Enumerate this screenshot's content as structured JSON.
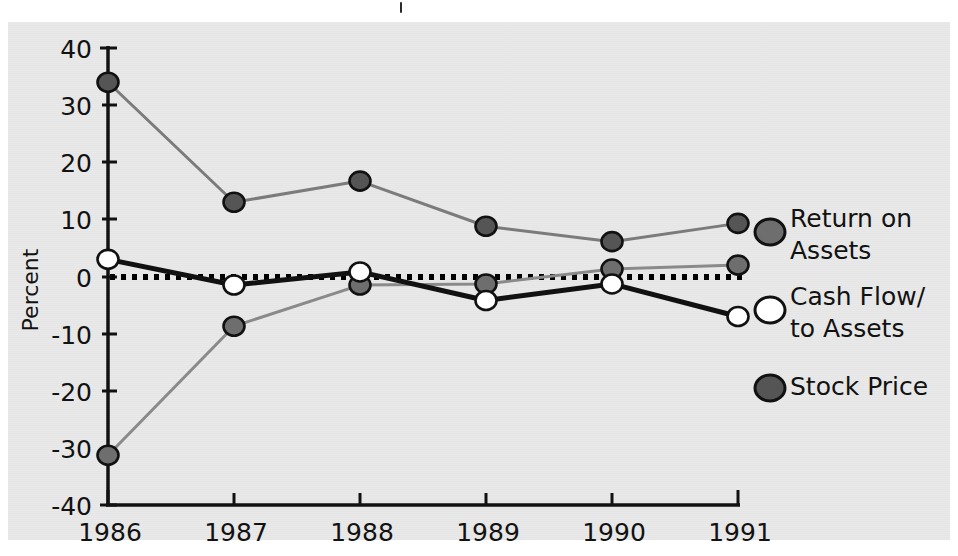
{
  "chart_data": {
    "type": "line",
    "title": "",
    "subtitle": "",
    "xlabel": "",
    "ylabel": "Percent",
    "categories": [
      "1986",
      "1987",
      "1988",
      "1989",
      "1990",
      "1991"
    ],
    "x": [
      1986,
      1987,
      1988,
      1989,
      1990,
      1991
    ],
    "xlim": [
      1986,
      1991
    ],
    "ylim": [
      -40,
      40
    ],
    "ytick_labels": [
      "40",
      "30",
      "20",
      "10",
      "0",
      "-10",
      "-20",
      "-30",
      "-40"
    ],
    "yticks": [
      40,
      30,
      20,
      10,
      0,
      -10,
      -20,
      -30,
      -40
    ],
    "grid": false,
    "zero_reference_line": {
      "value": 0,
      "style": "dotted",
      "color": "#000000"
    },
    "legend_position": "right",
    "series": [
      {
        "name": "Return on Assets",
        "legend_label_line1": "Return on",
        "legend_label_line2": "Assets",
        "values": [
          -31.3,
          -8.7,
          -1.5,
          -1.3,
          1.3,
          2.0
        ],
        "marker": "circle",
        "marker_fill": "#6e6e6e",
        "marker_edge": "#111111",
        "line_color": "#8a8a8a",
        "line_width": 3
      },
      {
        "name": "Cash Flow/to Assets",
        "legend_label_line1": "Cash Flow/",
        "legend_label_line2": "to Assets",
        "values": [
          3.0,
          -1.5,
          0.8,
          -4.2,
          -1.3,
          -7.0
        ],
        "marker": "circle",
        "marker_fill": "#ffffff",
        "marker_edge": "#111111",
        "line_color": "#111111",
        "line_width": 5
      },
      {
        "name": "Stock Price",
        "legend_label_line1": "Stock Price",
        "legend_label_line2": "",
        "values": [
          34.0,
          13.0,
          16.7,
          8.8,
          6.1,
          9.3
        ],
        "marker": "circle",
        "marker_fill": "#555555",
        "marker_edge": "#111111",
        "line_color": "#7b7b7b",
        "line_width": 3
      }
    ]
  },
  "axes": {
    "y_axis_label": "Percent",
    "y_tick_labels": [
      "40",
      "30",
      "20",
      "10",
      "0",
      "-10",
      "-20",
      "-30",
      "-40"
    ],
    "x_tick_labels": [
      "1986",
      "1987",
      "1988",
      "1989",
      "1990",
      "1991"
    ]
  },
  "legend": {
    "entries": [
      {
        "label_line1": "Return on",
        "label_line2": "Assets",
        "swatch_color": "#6e6e6e"
      },
      {
        "label_line1": "Cash Flow/",
        "label_line2": "to Assets",
        "swatch_color": "#ffffff"
      },
      {
        "label_line1": "Stock Price",
        "label_line2": "",
        "swatch_color": "#555555"
      }
    ]
  },
  "page": {
    "background_color": "#e9e9e9",
    "ink_color": "#121212"
  }
}
